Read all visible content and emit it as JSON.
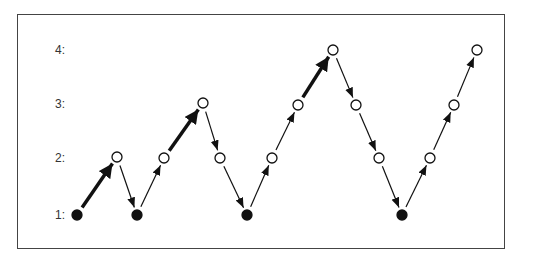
{
  "diagram": {
    "level_labels": [
      {
        "text": "4:",
        "y": 50
      },
      {
        "text": "3:",
        "y": 104
      },
      {
        "text": "2:",
        "y": 158
      },
      {
        "text": "1:",
        "y": 215
      }
    ],
    "nodes": [
      {
        "x": 77,
        "y": 215,
        "level": 1,
        "filled": true
      },
      {
        "x": 117,
        "y": 157,
        "level": 2,
        "filled": false
      },
      {
        "x": 137,
        "y": 215,
        "level": 1,
        "filled": true
      },
      {
        "x": 164,
        "y": 158,
        "level": 2,
        "filled": false
      },
      {
        "x": 203,
        "y": 103,
        "level": 3,
        "filled": false
      },
      {
        "x": 220,
        "y": 158,
        "level": 2,
        "filled": false
      },
      {
        "x": 247,
        "y": 215,
        "level": 1,
        "filled": true
      },
      {
        "x": 272,
        "y": 158,
        "level": 2,
        "filled": false
      },
      {
        "x": 298,
        "y": 105,
        "level": 3,
        "filled": false
      },
      {
        "x": 333,
        "y": 50,
        "level": 4,
        "filled": false
      },
      {
        "x": 356,
        "y": 105,
        "level": 3,
        "filled": false
      },
      {
        "x": 379,
        "y": 158,
        "level": 2,
        "filled": false
      },
      {
        "x": 402,
        "y": 215,
        "level": 1,
        "filled": true
      },
      {
        "x": 430,
        "y": 158,
        "level": 2,
        "filled": false
      },
      {
        "x": 454,
        "y": 105,
        "level": 3,
        "filled": false
      },
      {
        "x": 477,
        "y": 50,
        "level": 4,
        "filled": false
      }
    ],
    "edges": [
      {
        "from": 0,
        "to": 1,
        "thick": true
      },
      {
        "from": 1,
        "to": 2,
        "thick": false
      },
      {
        "from": 2,
        "to": 3,
        "thick": false
      },
      {
        "from": 3,
        "to": 4,
        "thick": true
      },
      {
        "from": 4,
        "to": 5,
        "thick": false
      },
      {
        "from": 5,
        "to": 6,
        "thick": false
      },
      {
        "from": 6,
        "to": 7,
        "thick": false
      },
      {
        "from": 7,
        "to": 8,
        "thick": false
      },
      {
        "from": 8,
        "to": 9,
        "thick": true
      },
      {
        "from": 9,
        "to": 10,
        "thick": false
      },
      {
        "from": 10,
        "to": 11,
        "thick": false
      },
      {
        "from": 11,
        "to": 12,
        "thick": false
      },
      {
        "from": 12,
        "to": 13,
        "thick": false
      },
      {
        "from": 13,
        "to": 14,
        "thick": false
      },
      {
        "from": 14,
        "to": 15,
        "thick": false
      }
    ],
    "colors": {
      "stroke": "#111111",
      "frame": "#444444",
      "fill_open": "#ffffff",
      "fill_closed": "#111111"
    }
  }
}
